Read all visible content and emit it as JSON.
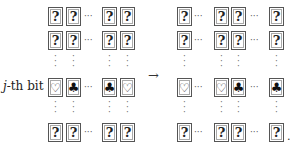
{
  "row_label": {
    "var": "j",
    "rest": "-th bit"
  },
  "symbols": {
    "unknown": "?",
    "heart": "♡",
    "club": "♣",
    "hdots": "···",
    "vdots": "⋮",
    "arrow": "→",
    "period": "."
  },
  "left_grid": {
    "rows": [
      [
        "?",
        "?",
        "?",
        "?"
      ],
      [
        "?",
        "?",
        "?",
        "?"
      ],
      [
        "♡",
        "♣",
        "♣",
        "♡"
      ],
      [
        "?",
        "?",
        "?",
        "?"
      ]
    ]
  },
  "right_grid": {
    "rows": [
      [
        "?",
        "?",
        "?",
        "?"
      ],
      [
        "?",
        "?",
        "?",
        "?"
      ],
      [
        "♡",
        "♡",
        "♣",
        "♣"
      ],
      [
        "?",
        "?",
        "?",
        "?"
      ]
    ]
  }
}
